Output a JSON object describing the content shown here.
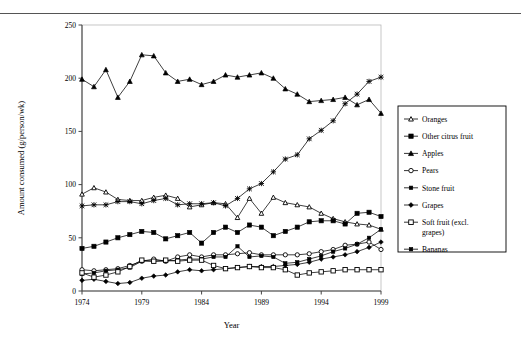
{
  "figure": {
    "background_color": "#ffffff",
    "line_color": "#000000",
    "top_rule_color": "#555555"
  },
  "chart_data": {
    "type": "line",
    "title": "",
    "xlabel": "Year",
    "ylabel": "Amount consumed (g/person/wk)",
    "xlim": [
      1974,
      1999
    ],
    "ylim": [
      0,
      250
    ],
    "ytick_values": [
      0,
      50,
      100,
      150,
      200,
      250
    ],
    "ytick_labels": [
      "0",
      "50",
      "100",
      "150",
      "200",
      "250"
    ],
    "xtick_values": [
      1974,
      1979,
      1984,
      1989,
      1994,
      1999
    ],
    "xtick_labels": [
      "1974",
      "1979",
      "1984",
      "1989",
      "1994",
      "1999"
    ],
    "grid": false,
    "legend_position": "right-outside",
    "x": [
      1974,
      1975,
      1976,
      1977,
      1978,
      1979,
      1980,
      1981,
      1982,
      1983,
      1984,
      1985,
      1986,
      1987,
      1988,
      1989,
      1990,
      1991,
      1992,
      1993,
      1994,
      1995,
      1996,
      1997,
      1998,
      1999
    ],
    "series": [
      {
        "name": "Oranges",
        "marker": "open-triangle",
        "values": [
          91,
          97,
          93,
          86,
          85,
          85,
          88,
          90,
          87,
          79,
          81,
          83,
          82,
          69,
          87,
          73,
          88,
          83,
          81,
          79,
          73,
          68,
          65,
          63,
          62,
          58
        ]
      },
      {
        "name": "Other citrus fruit",
        "marker": "filled-square",
        "values": [
          40,
          42,
          46,
          50,
          53,
          56,
          55,
          49,
          52,
          55,
          45,
          55,
          60,
          55,
          62,
          60,
          52,
          56,
          60,
          65,
          66,
          66,
          63,
          73,
          74,
          70
        ]
      },
      {
        "name": "Apples",
        "marker": "filled-triangle",
        "values": [
          199,
          192,
          208,
          182,
          197,
          222,
          221,
          205,
          197,
          199,
          194,
          197,
          203,
          201,
          203,
          205,
          200,
          190,
          185,
          178,
          179,
          180,
          182,
          175,
          180,
          167
        ]
      },
      {
        "name": "Pears",
        "marker": "open-circle",
        "values": [
          20,
          19,
          20,
          21,
          24,
          28,
          30,
          28,
          32,
          34,
          32,
          34,
          34,
          35,
          36,
          34,
          34,
          34,
          34,
          35,
          37,
          39,
          43,
          44,
          46,
          39
        ]
      },
      {
        "name": "Stone fruit",
        "marker": "small-filled-square",
        "values": [
          16,
          17,
          19,
          20,
          22,
          28,
          28,
          28,
          29,
          30,
          30,
          32,
          32,
          42,
          32,
          33,
          32,
          26,
          27,
          30,
          33,
          37,
          40,
          44,
          50,
          58
        ]
      },
      {
        "name": "Grapes",
        "marker": "filled-diamond",
        "values": [
          10,
          11,
          9,
          7,
          8,
          12,
          14,
          15,
          18,
          20,
          19,
          20,
          21,
          22,
          23,
          23,
          23,
          24,
          25,
          27,
          30,
          32,
          34,
          37,
          41,
          46
        ]
      },
      {
        "name": "Soft fruit (excl. grapes)",
        "marker": "open-square",
        "values": [
          17,
          13,
          15,
          18,
          23,
          29,
          28,
          29,
          28,
          29,
          29,
          24,
          21,
          22,
          23,
          22,
          22,
          20,
          15,
          17,
          18,
          19,
          20,
          20,
          20,
          20
        ]
      },
      {
        "name": "Bananas",
        "marker": "star",
        "values": [
          80,
          81,
          81,
          84,
          84,
          82,
          85,
          87,
          81,
          82,
          82,
          83,
          80,
          87,
          96,
          101,
          112,
          124,
          128,
          143,
          151,
          160,
          176,
          185,
          197,
          201
        ]
      }
    ]
  },
  "legend": {
    "entries": [
      {
        "label": "Oranges"
      },
      {
        "label": "Other citrus fruit"
      },
      {
        "label": "Apples"
      },
      {
        "label": "Pears"
      },
      {
        "label": "Stone fruit"
      },
      {
        "label": "Grapes"
      },
      {
        "label": "Soft fruit (excl."
      },
      {
        "label": "grapes)"
      },
      {
        "label": "Bananas"
      }
    ]
  }
}
